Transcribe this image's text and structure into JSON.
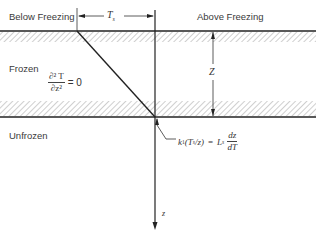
{
  "diagram": {
    "regions": {
      "below_freezing": "Below Freezing",
      "above_freezing": "Above Freezing",
      "frozen": "Frozen",
      "unfrozen": "Unfrozen"
    },
    "dimensions": {
      "surface_temperature": {
        "symbol": "T",
        "subscript": "s"
      },
      "frost_depth": {
        "symbol": "Z"
      }
    },
    "equations": {
      "frozen_zone": {
        "numerator": "∂² T",
        "denominator": "∂z²",
        "rhs": "= 0"
      },
      "interface": {
        "lhs_k": "k",
        "lhs_k_sub": "1",
        "lhs_paren_open": "(T",
        "lhs_T_sub": "s",
        "lhs_rest": "/z)",
        "equals": "=",
        "L": "L",
        "L_sub": "s",
        "frac_num": "dz",
        "frac_den": "dT"
      }
    },
    "axis": {
      "depth_label": "z"
    },
    "colors": {
      "line": "#222222",
      "hatch": "#9a9a9a",
      "text": "#3a3a3a"
    }
  }
}
